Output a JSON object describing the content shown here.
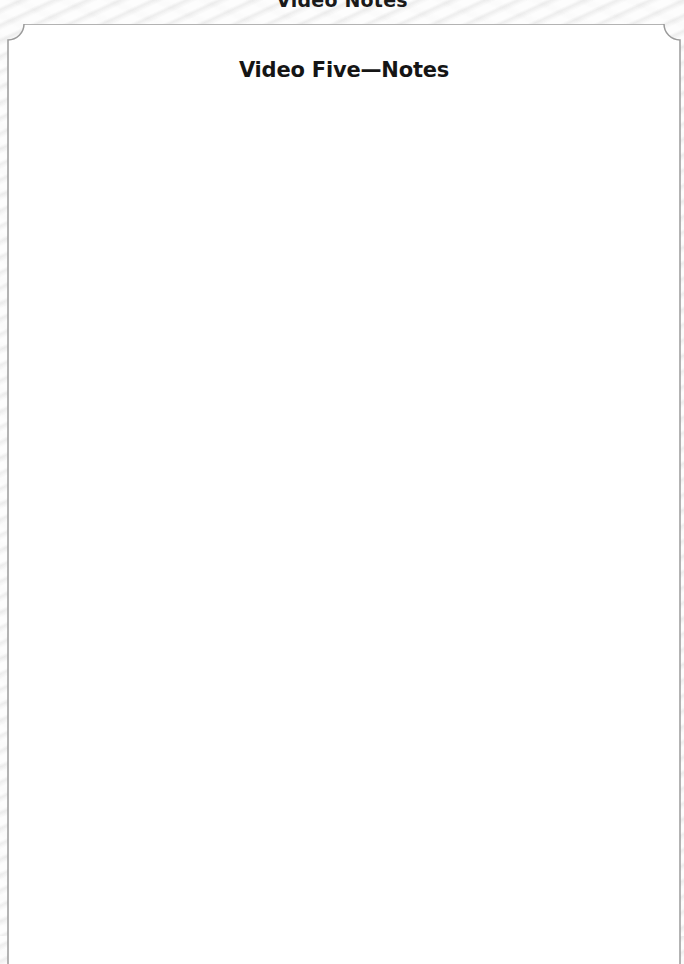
{
  "header": {
    "title": "Video Notes"
  },
  "card": {
    "title": "Video Five—Notes",
    "notes_body": ""
  },
  "colors": {
    "border": "#9a9a9a",
    "card_background": "#ffffff",
    "page_background": "#f3f3f3",
    "title_text": "#151515"
  }
}
